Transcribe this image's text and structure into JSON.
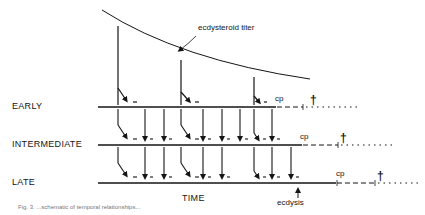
{
  "diagram": {
    "curve_label": "ecdysteroid titer",
    "rows": [
      {
        "label": "EARLY",
        "cp_label": "cp"
      },
      {
        "label": "INTERMEDIATE",
        "cp_label": "cp"
      },
      {
        "label": "LATE",
        "cp_label": "cp"
      }
    ],
    "x_axis_label": "TIME",
    "event_label": "ecdysis",
    "death_marker": "†",
    "caption": "Fig. 3.  ...schematic of temporal relationships..."
  },
  "colors": {
    "ink": "#151515",
    "background": "#ffffff"
  }
}
